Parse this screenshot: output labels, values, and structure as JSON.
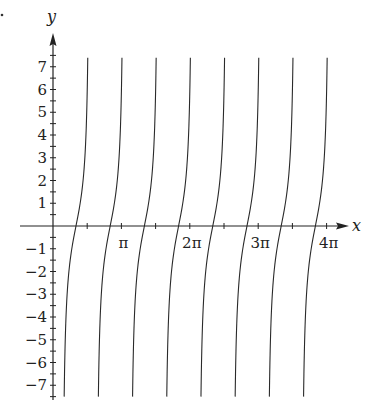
{
  "chart_data": {
    "type": "line",
    "title": "",
    "xlabel": "x",
    "ylabel": "y",
    "xlim": [
      -0.48,
      4.4
    ],
    "xlim_units": "multiples of pi",
    "ylim": [
      -7.5,
      7.5
    ],
    "grid": false,
    "legend": null,
    "x_ticks": [
      {
        "value": 0.5,
        "label": ""
      },
      {
        "value": 1,
        "label": "π"
      },
      {
        "value": 1.5,
        "label": ""
      },
      {
        "value": 2,
        "label": "2π"
      },
      {
        "value": 2.5,
        "label": ""
      },
      {
        "value": 3,
        "label": "3π"
      },
      {
        "value": 3.5,
        "label": ""
      },
      {
        "value": 4,
        "label": "4π"
      }
    ],
    "y_ticks": [
      {
        "value": 7,
        "label": "7"
      },
      {
        "value": 6,
        "label": "6"
      },
      {
        "value": 5,
        "label": "5"
      },
      {
        "value": 4,
        "label": "4"
      },
      {
        "value": 3,
        "label": "3"
      },
      {
        "value": 2,
        "label": "2"
      },
      {
        "value": 1,
        "label": "1"
      },
      {
        "value": -1,
        "label": "−1"
      },
      {
        "value": -2,
        "label": "−2"
      },
      {
        "value": -3,
        "label": "−3"
      },
      {
        "value": -4,
        "label": "−4"
      },
      {
        "value": -5,
        "label": "−5"
      },
      {
        "value": -6,
        "label": "−6"
      },
      {
        "value": -7,
        "label": "−7"
      }
    ],
    "y_minor_tick_step": 0.5,
    "curve_family": {
      "description": "Family of nearly vertical increasing curves, one per half-period, crossing the x-axis at approximately 0.336π + nπ/2",
      "count": 8,
      "x_axis_crossings_pi": [
        0.336,
        0.836,
        1.336,
        1.836,
        2.336,
        2.836,
        3.336,
        3.836
      ],
      "x_at_top_pi": [
        0.5,
        1.0,
        1.5,
        2.0,
        2.5,
        3.0,
        3.5,
        4.0
      ],
      "x_at_bottom_pi": [
        0.16,
        0.66,
        1.16,
        1.66,
        2.16,
        2.66,
        3.16,
        3.66
      ],
      "y_range": [
        -7.5,
        7.4
      ],
      "shape_amplitude_pi": 0.207,
      "shape_scale": 2
    }
  },
  "axes": {
    "x_label": "x",
    "y_label": "y"
  },
  "colors": {
    "axis": "#222222",
    "curve": "#2a2a2a",
    "background": "#ffffff"
  }
}
